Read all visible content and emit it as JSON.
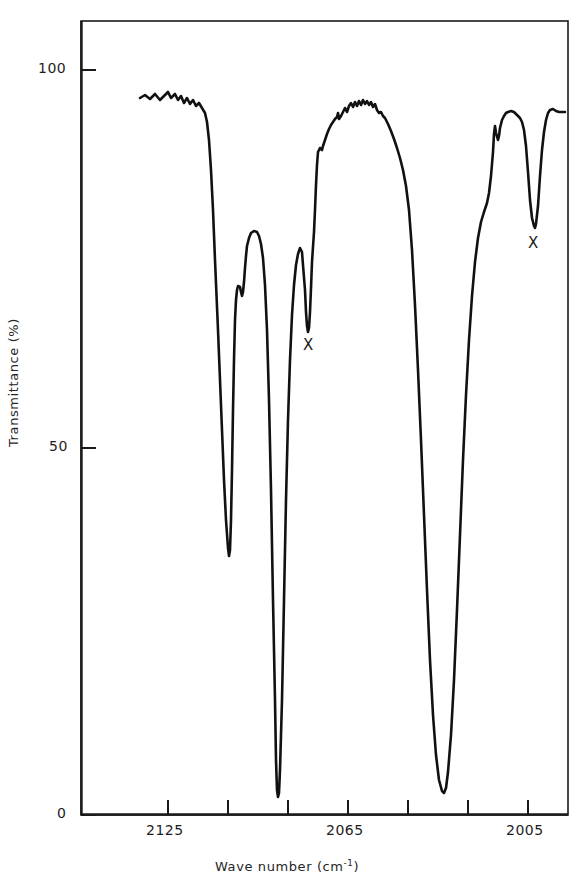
{
  "chart_data": {
    "type": "line",
    "title": "",
    "xlabel": "Wave number (cm-1)",
    "ylabel": "Transmittance (%)",
    "xlabel_base": "Wave number (cm",
    "xlabel_sup": "-1",
    "xlabel_close": ")",
    "xlim": [
      2145,
      1992
    ],
    "ylim": [
      0,
      103
    ],
    "x_tick_values": [
      2125,
      2105,
      2085,
      2065,
      2045,
      2025,
      2005,
      1992
    ],
    "x_tick_labels": [
      "2125",
      "",
      "",
      "2065",
      "",
      "",
      "2005",
      ""
    ],
    "x_labeled_ticks": [
      {
        "value": "2125",
        "px": 168
      },
      {
        "value": "2065",
        "px": 348
      },
      {
        "value": "2005",
        "px": 528
      }
    ],
    "y_tick_values": [
      0,
      50,
      100
    ],
    "y_tick_labels": [
      "0",
      "50",
      "100"
    ],
    "grid": false,
    "legend": false,
    "annotations": [
      {
        "label": "X",
        "x_px": 308,
        "y_px": 345,
        "note": "weak narrow band near 2058 cm-1"
      },
      {
        "label": "X",
        "x_px": 533,
        "y_px": 243,
        "note": "weak narrow band near 2003 cm-1"
      }
    ],
    "series": [
      {
        "name": "IR transmittance spectrum",
        "points_px": [
          [
            140,
            98
          ],
          [
            145,
            95
          ],
          [
            150,
            99
          ],
          [
            155,
            94
          ],
          [
            160,
            100
          ],
          [
            164,
            96
          ],
          [
            168,
            92
          ],
          [
            171,
            98
          ],
          [
            175,
            94
          ],
          [
            178,
            100
          ],
          [
            181,
            96
          ],
          [
            184,
            103
          ],
          [
            187,
            98
          ],
          [
            190,
            104
          ],
          [
            193,
            100
          ],
          [
            196,
            106
          ],
          [
            199,
            103
          ],
          [
            202,
            108
          ],
          [
            205,
            113
          ],
          [
            207,
            122
          ],
          [
            209,
            140
          ],
          [
            211,
            170
          ],
          [
            213,
            210
          ],
          [
            215,
            260
          ],
          [
            218,
            330
          ],
          [
            221,
            405
          ],
          [
            224,
            480
          ],
          [
            226,
            520
          ],
          [
            228,
            548
          ],
          [
            229,
            556
          ],
          [
            230,
            550
          ],
          [
            231,
            520
          ],
          [
            232,
            470
          ],
          [
            233,
            410
          ],
          [
            234,
            360
          ],
          [
            235,
            320
          ],
          [
            236,
            300
          ],
          [
            237,
            290
          ],
          [
            238,
            286
          ],
          [
            240,
            287
          ],
          [
            241,
            292
          ],
          [
            242,
            296
          ],
          [
            243,
            292
          ],
          [
            244,
            282
          ],
          [
            245,
            268
          ],
          [
            246,
            256
          ],
          [
            247,
            246
          ],
          [
            249,
            238
          ],
          [
            251,
            233
          ],
          [
            254,
            231
          ],
          [
            257,
            232
          ],
          [
            259,
            236
          ],
          [
            261,
            244
          ],
          [
            263,
            258
          ],
          [
            265,
            285
          ],
          [
            267,
            330
          ],
          [
            269,
            400
          ],
          [
            271,
            490
          ],
          [
            273,
            600
          ],
          [
            275,
            700
          ],
          [
            276,
            760
          ],
          [
            277,
            790
          ],
          [
            278,
            797
          ],
          [
            279,
            793
          ],
          [
            280,
            770
          ],
          [
            282,
            700
          ],
          [
            284,
            600
          ],
          [
            286,
            500
          ],
          [
            288,
            420
          ],
          [
            290,
            360
          ],
          [
            292,
            315
          ],
          [
            294,
            285
          ],
          [
            296,
            265
          ],
          [
            298,
            254
          ],
          [
            300,
            248
          ],
          [
            302,
            252
          ],
          [
            303,
            265
          ],
          [
            305,
            290
          ],
          [
            306,
            312
          ],
          [
            307,
            326
          ],
          [
            308,
            332
          ],
          [
            309,
            328
          ],
          [
            310,
            312
          ],
          [
            311,
            288
          ],
          [
            312,
            262
          ],
          [
            314,
            232
          ],
          [
            315,
            210
          ],
          [
            316,
            185
          ],
          [
            317,
            165
          ],
          [
            318,
            152
          ],
          [
            320,
            148
          ],
          [
            322,
            150
          ],
          [
            323,
            146
          ],
          [
            325,
            140
          ],
          [
            327,
            134
          ],
          [
            329,
            129
          ],
          [
            331,
            125
          ],
          [
            333,
            122
          ],
          [
            335,
            119
          ],
          [
            337,
            117
          ],
          [
            338,
            113
          ],
          [
            339,
            119
          ],
          [
            341,
            116
          ],
          [
            343,
            112
          ],
          [
            345,
            108
          ],
          [
            347,
            112
          ],
          [
            349,
            106
          ],
          [
            351,
            103
          ],
          [
            353,
            107
          ],
          [
            355,
            102
          ],
          [
            357,
            106
          ],
          [
            359,
            101
          ],
          [
            361,
            105
          ],
          [
            363,
            100
          ],
          [
            365,
            104
          ],
          [
            367,
            101
          ],
          [
            369,
            105
          ],
          [
            371,
            102
          ],
          [
            373,
            107
          ],
          [
            375,
            104
          ],
          [
            377,
            110
          ],
          [
            379,
            113
          ],
          [
            381,
            112
          ],
          [
            383,
            116
          ],
          [
            385,
            118
          ],
          [
            388,
            124
          ],
          [
            391,
            131
          ],
          [
            394,
            139
          ],
          [
            397,
            148
          ],
          [
            400,
            158
          ],
          [
            403,
            170
          ],
          [
            406,
            186
          ],
          [
            409,
            210
          ],
          [
            412,
            250
          ],
          [
            415,
            305
          ],
          [
            418,
            370
          ],
          [
            421,
            440
          ],
          [
            424,
            515
          ],
          [
            427,
            590
          ],
          [
            430,
            660
          ],
          [
            433,
            715
          ],
          [
            436,
            755
          ],
          [
            439,
            780
          ],
          [
            442,
            791
          ],
          [
            444,
            793
          ],
          [
            446,
            788
          ],
          [
            448,
            772
          ],
          [
            451,
            735
          ],
          [
            454,
            680
          ],
          [
            457,
            610
          ],
          [
            460,
            535
          ],
          [
            463,
            460
          ],
          [
            466,
            395
          ],
          [
            469,
            340
          ],
          [
            472,
            296
          ],
          [
            475,
            262
          ],
          [
            478,
            238
          ],
          [
            481,
            222
          ],
          [
            484,
            212
          ],
          [
            487,
            203
          ],
          [
            489,
            193
          ],
          [
            491,
            176
          ],
          [
            493,
            152
          ],
          [
            494,
            134
          ],
          [
            495,
            126
          ],
          [
            496,
            133
          ],
          [
            498,
            140
          ],
          [
            499,
            136
          ],
          [
            500,
            128
          ],
          [
            502,
            120
          ],
          [
            504,
            116
          ],
          [
            506,
            113
          ],
          [
            508,
            112
          ],
          [
            511,
            111
          ],
          [
            514,
            112
          ],
          [
            517,
            115
          ],
          [
            520,
            118
          ],
          [
            522,
            122
          ],
          [
            524,
            130
          ],
          [
            526,
            146
          ],
          [
            528,
            172
          ],
          [
            530,
            200
          ],
          [
            532,
            218
          ],
          [
            534,
            226
          ],
          [
            535,
            228
          ],
          [
            536,
            224
          ],
          [
            538,
            206
          ],
          [
            540,
            176
          ],
          [
            542,
            150
          ],
          [
            544,
            132
          ],
          [
            546,
            120
          ],
          [
            548,
            113
          ],
          [
            550,
            110
          ],
          [
            553,
            109
          ],
          [
            556,
            111
          ],
          [
            559,
            112
          ],
          [
            562,
            112
          ],
          [
            565,
            112
          ]
        ]
      }
    ]
  },
  "axes": {
    "y_label": "Transmittance (%)",
    "y_ticks": [
      {
        "label": "100",
        "px": 70
      },
      {
        "label": "50",
        "px": 448
      },
      {
        "label": "0",
        "px": 815
      }
    ],
    "frame": {
      "left": 81,
      "top": 21,
      "right": 568,
      "bottom": 815
    }
  }
}
